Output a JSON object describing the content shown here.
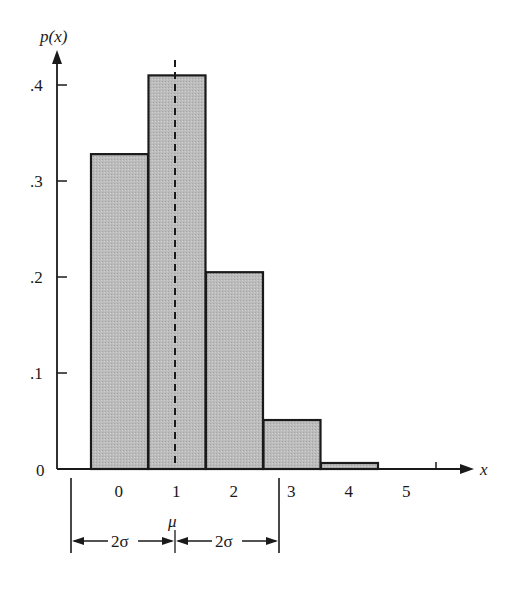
{
  "chart_data": {
    "type": "bar",
    "title": "",
    "xlabel": "x",
    "ylabel": "p(x)",
    "categories": [
      "0",
      "1",
      "2",
      "3",
      "4",
      "5"
    ],
    "values": [
      0.328,
      0.41,
      0.205,
      0.051,
      0.006,
      0.0
    ],
    "ylim": [
      0,
      0.45
    ],
    "y_ticks": [
      ".1",
      ".2",
      ".3",
      ".4"
    ],
    "y_zero_label": "0",
    "x_ticks": [
      "0",
      "1",
      "2",
      "3",
      "4",
      "5"
    ],
    "grid": false,
    "legend": null,
    "annotations": {
      "mean_line": {
        "x": 1,
        "style": "dashed",
        "label": "μ"
      },
      "interval_left_label": "2σ",
      "interval_right_label": "2σ",
      "interval_left_x": -0.78,
      "interval_right_x": 2.78
    },
    "bar_fill": "#b8b8b8",
    "bar_stroke": "#1a1a1a"
  }
}
